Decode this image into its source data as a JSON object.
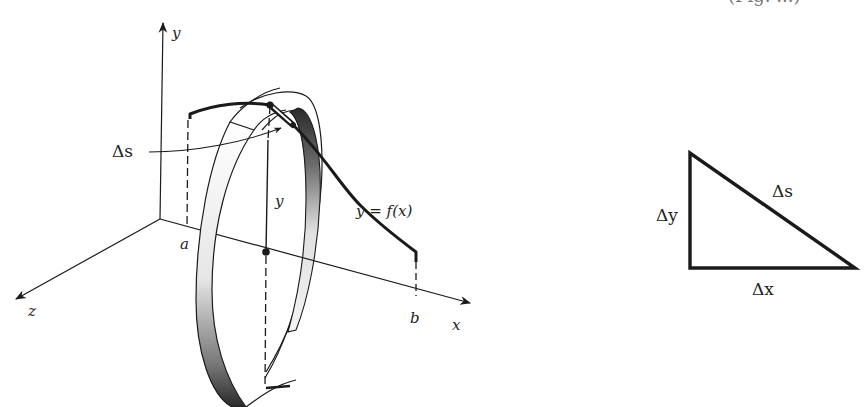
{
  "figure": {
    "caption_fragment": "(Fig. ...)",
    "left_diagram": {
      "description": "Surface of revolution: a thin band generated by rotating arc length element Δs of y = f(x) about the x-axis",
      "axes": {
        "x_label": "x",
        "y_label": "y",
        "z_label": "z"
      },
      "interval": {
        "start_label": "a",
        "end_label": "b"
      },
      "curve_label": "y = f(x)",
      "radius_label": "y",
      "arc_element_label": "Δs"
    },
    "right_diagram": {
      "description": "Right triangle relating arc element to coordinate increments",
      "hypotenuse_label": "Δs",
      "vertical_leg_label": "Δy",
      "horizontal_leg_label": "Δx"
    },
    "colors": {
      "line": "#1a1a1a",
      "band_shade_dark": "#2a2a2a",
      "band_shade_light": "#f4f4f4",
      "background": "#ffffff"
    }
  }
}
